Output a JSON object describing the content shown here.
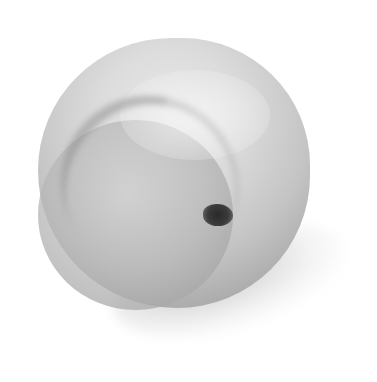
{
  "image": {
    "subject": "peach",
    "style": "grayscale photograph",
    "background": "#ffffff",
    "colors": {
      "skin_light": "#e9e9e9",
      "skin_mid": "#c4c4c4",
      "skin_dark": "#9a9a9a",
      "stem_cavity": "#2a2a2a",
      "shadow": "#969696"
    }
  }
}
